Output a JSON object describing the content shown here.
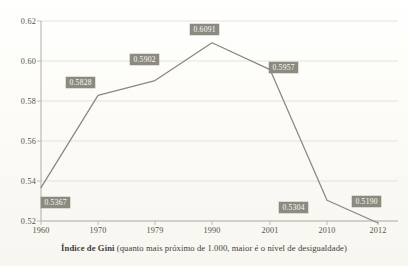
{
  "caption": {
    "lead": "Índice de Gini",
    "rest": " (quanto mais próximo de 1.000, maior é o nível de desigualdade)",
    "full": "Índice de Gini (quanto mais próximo de 1.000, maior é o nível de desigualdade)"
  },
  "colors": {
    "line": "#8a877d",
    "label_badge": "#8d8a80",
    "label_text": "#fbfbf8",
    "grid": "#dedcd4",
    "axis": "#b7b4ab",
    "tick_text": "#56534c",
    "background": "#fbfaf6"
  },
  "chart_data": {
    "type": "line",
    "title": "Índice de Gini (quanto mais próximo de 1.000, maior é o nível de desigualdade)",
    "xlabel": "",
    "ylabel": "",
    "categories": [
      "1960",
      "1970",
      "1979",
      "1990",
      "2001",
      "2010",
      "2012"
    ],
    "values": [
      0.5367,
      0.5828,
      0.5902,
      0.6091,
      0.5957,
      0.5304,
      0.519
    ],
    "point_labels": [
      "0.5367",
      "0.5828",
      "0.5902",
      "0.6091",
      "0.5957",
      "0.5304",
      "0.5190"
    ],
    "ylim": [
      0.52,
      0.62
    ],
    "yticks": [
      "0.62",
      "0.60",
      "0.58",
      "0.56",
      "0.54",
      "0.52"
    ],
    "ytick_values": [
      0.62,
      0.6,
      0.58,
      0.56,
      0.54,
      0.52
    ],
    "xticks": [
      "1960",
      "1970",
      "1979",
      "1990",
      "2001",
      "2010",
      "2012"
    ],
    "grid": true,
    "legend": "none",
    "series": [
      {
        "name": "Índice de Gini",
        "values": [
          0.5367,
          0.5828,
          0.5902,
          0.6091,
          0.5957,
          0.5304,
          0.519
        ]
      }
    ]
  }
}
